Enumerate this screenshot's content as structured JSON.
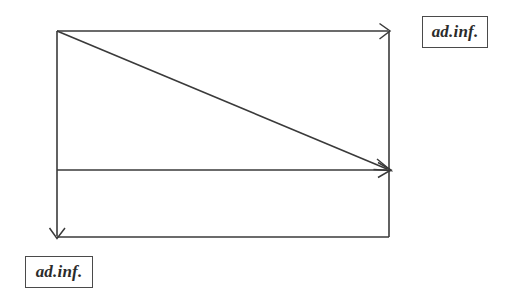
{
  "diagram": {
    "background_color": "#ffffff",
    "stroke_color": "#3a3a3a",
    "stroke_width": 1.6,
    "labels": [
      {
        "id": "top-right",
        "text": "ad.inf.",
        "x": 422,
        "y": 16,
        "width": 66,
        "height": 32
      },
      {
        "id": "bottom-left",
        "text": "ad.inf.",
        "x": 25,
        "y": 256,
        "width": 68,
        "height": 32
      }
    ],
    "geometry": {
      "rect": {
        "left": 57,
        "top": 31,
        "right": 389,
        "bottom": 237
      },
      "middle_line_y": 170
    },
    "segments": [
      {
        "name": "top-horizontal-arrow",
        "from": [
          57,
          31
        ],
        "to": [
          389,
          31
        ],
        "arrow_at_end": true
      },
      {
        "name": "left-vertical-arrow",
        "from": [
          57,
          31
        ],
        "to": [
          57,
          237
        ],
        "arrow_at_end": true
      },
      {
        "name": "right-vertical-line",
        "from": [
          389,
          31
        ],
        "to": [
          389,
          237
        ],
        "arrow_at_end": false
      },
      {
        "name": "bottom-horizontal-line",
        "from": [
          57,
          237
        ],
        "to": [
          389,
          237
        ],
        "arrow_at_end": false
      },
      {
        "name": "middle-horizontal-arrow",
        "from": [
          57,
          170
        ],
        "to": [
          389,
          170
        ],
        "arrow_at_end": true
      },
      {
        "name": "diagonal-arrow",
        "from": [
          57,
          31
        ],
        "to": [
          389,
          170
        ],
        "arrow_at_end": true
      }
    ]
  }
}
